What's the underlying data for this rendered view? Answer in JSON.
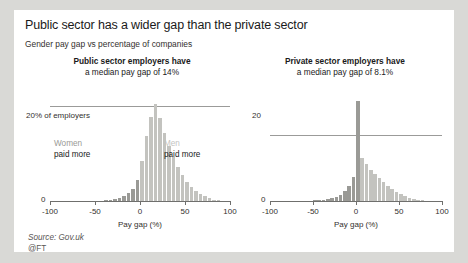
{
  "headline": "Public sector has a wider gap than the private sector",
  "subhead": "Gender pay gap vs percentage of companies",
  "footer": {
    "source": "Source: Gov.uk",
    "credit": "@FT"
  },
  "colors": {
    "bar_light": "#c3c3bf",
    "bar_dark": "#9a9a96",
    "axis": "#6f6f6d",
    "grid": "#9b9b99",
    "text": "#1a1a1a",
    "page_bg": "#d9d9d6",
    "panel_bg": "#ffffff"
  },
  "annotations": {
    "women_label": "Women",
    "women_sub": "paid more",
    "men_label": "Men",
    "men_sub": "paid more"
  },
  "chart_data": [
    {
      "type": "bar",
      "id": "public-sector",
      "title_line1": "Public sector employers have",
      "title_line2": "a median pay gap of 14%",
      "median_pay_gap": 14,
      "xlabel": "Pay gap (%)",
      "ylabel": "% of employers",
      "xlim": [
        -100,
        100
      ],
      "ylim": [
        0,
        22
      ],
      "xticks": [
        -100,
        -50,
        0,
        50,
        100
      ],
      "xticklabels": [
        "-100",
        "-50",
        "0",
        "50",
        "100"
      ],
      "yticks": [
        0,
        20
      ],
      "yticklabels": [
        "0",
        "20% of employers"
      ],
      "grid": true,
      "bin_width": 5,
      "x": [
        -100,
        -95,
        -90,
        -85,
        -80,
        -75,
        -70,
        -65,
        -60,
        -55,
        -50,
        -45,
        -40,
        -35,
        -30,
        -25,
        -20,
        -15,
        -10,
        -5,
        0,
        5,
        10,
        15,
        20,
        25,
        30,
        35,
        40,
        45,
        50,
        55,
        60,
        65,
        70,
        75,
        80,
        85,
        90,
        95
      ],
      "values": [
        0,
        0,
        0,
        0,
        0,
        0,
        0,
        0,
        0,
        0,
        0.1,
        0.1,
        0.2,
        0.3,
        0.4,
        0.6,
        1.0,
        1.6,
        2.6,
        4.4,
        8.4,
        13.6,
        17.6,
        20.3,
        17.4,
        14.2,
        11.5,
        9.2,
        7.2,
        5.4,
        4.0,
        3.0,
        2.2,
        1.5,
        1.0,
        0.6,
        0.3,
        0.2,
        0.1,
        0.1
      ],
      "bar_colors": [
        "dark",
        "dark",
        "dark",
        "dark",
        "dark",
        "dark",
        "dark",
        "dark",
        "dark",
        "dark",
        "dark",
        "dark",
        "dark",
        "dark",
        "dark",
        "dark",
        "dark",
        "dark",
        "dark",
        "dark",
        "light",
        "light",
        "light",
        "light",
        "light",
        "light",
        "light",
        "light",
        "light",
        "light",
        "light",
        "light",
        "light",
        "light",
        "light",
        "light",
        "light",
        "light",
        "light",
        "light"
      ]
    },
    {
      "type": "bar",
      "id": "private-sector",
      "title_line1": "Private sector employers have",
      "title_line2": "a median pay gap of 8.1%",
      "median_pay_gap": 8.1,
      "xlabel": "Pay gap (%)",
      "ylabel": "% of employers",
      "xlim": [
        -100,
        100
      ],
      "ylim": [
        0,
        32
      ],
      "xticks": [
        -100,
        -50,
        0,
        50,
        100
      ],
      "xticklabels": [
        "-100",
        "-50",
        "0",
        "50",
        "100"
      ],
      "yticks": [
        0,
        20
      ],
      "yticklabels": [
        "0",
        "20"
      ],
      "grid": true,
      "bin_width": 5,
      "x": [
        -100,
        -95,
        -90,
        -85,
        -80,
        -75,
        -70,
        -65,
        -60,
        -55,
        -50,
        -45,
        -40,
        -35,
        -30,
        -25,
        -20,
        -15,
        -10,
        -5,
        0,
        5,
        10,
        15,
        20,
        25,
        30,
        35,
        40,
        45,
        50,
        55,
        60,
        65,
        70,
        75,
        80,
        85,
        90,
        95
      ],
      "values": [
        0,
        0,
        0,
        0,
        0,
        0,
        0,
        0,
        0,
        0,
        0.2,
        0.2,
        0.3,
        0.5,
        0.8,
        1.2,
        1.9,
        3.0,
        4.6,
        7.2,
        30.5,
        13.2,
        11.2,
        9.6,
        8.2,
        7.0,
        5.8,
        4.6,
        3.6,
        2.8,
        2.0,
        1.4,
        0.9,
        0.6,
        0.4,
        0.2,
        0.1,
        0.1,
        0.0,
        0.0
      ],
      "bar_colors": [
        "dark",
        "dark",
        "dark",
        "dark",
        "dark",
        "dark",
        "dark",
        "dark",
        "dark",
        "dark",
        "dark",
        "dark",
        "dark",
        "dark",
        "dark",
        "dark",
        "dark",
        "dark",
        "dark",
        "dark",
        "dark",
        "light",
        "light",
        "light",
        "light",
        "light",
        "light",
        "light",
        "light",
        "light",
        "light",
        "light",
        "light",
        "light",
        "light",
        "light",
        "light",
        "light",
        "light",
        "light"
      ]
    }
  ]
}
